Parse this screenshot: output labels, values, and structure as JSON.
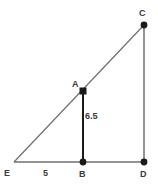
{
  "figure": {
    "background_color": "#ffffff",
    "line_color": "#6f6f6f",
    "emphasis_line_color": "#1a1a1a",
    "marker_color": "#1a1a1a",
    "text_color": "#3a3a3a",
    "width": 158,
    "height": 186
  },
  "vertices": [
    {
      "id": "E",
      "label": "E",
      "x": 14,
      "y": 162,
      "marker": "none"
    },
    {
      "id": "B",
      "label": "B",
      "x": 83,
      "y": 162,
      "marker": "dot"
    },
    {
      "id": "D",
      "label": "D",
      "x": 144,
      "y": 162,
      "marker": "dot"
    },
    {
      "id": "A",
      "label": "A",
      "x": 83,
      "y": 91,
      "marker": "square"
    },
    {
      "id": "C",
      "label": "C",
      "x": 144,
      "y": 25,
      "marker": "dot"
    }
  ],
  "segments": [
    {
      "id": "EC",
      "from": "E",
      "to": "C",
      "style": "thin",
      "color": "#6f6f6f"
    },
    {
      "id": "ED",
      "from": "E",
      "to": "D",
      "style": "thin",
      "color": "#6f6f6f"
    },
    {
      "id": "CD",
      "from": "C",
      "to": "D",
      "style": "thin",
      "color": "#6f6f6f"
    },
    {
      "id": "AB",
      "from": "A",
      "to": "B",
      "style": "thick",
      "color": "#1a1a1a"
    }
  ],
  "measurements": [
    {
      "id": "AB",
      "segment": "AB",
      "value": "6.5"
    },
    {
      "id": "EB",
      "segment": "EB",
      "value": "5"
    }
  ],
  "labels": {
    "E": "E",
    "B": "B",
    "D": "D",
    "A": "A",
    "C": "C",
    "length_AB": "6.5",
    "length_EB": "5"
  }
}
